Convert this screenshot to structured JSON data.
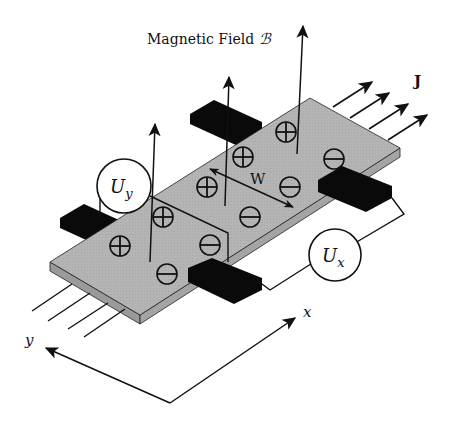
{
  "labels": {
    "magnetic_field": "Magnetic Field",
    "magnetic_field_symbol": "ℬ",
    "current_density": "J",
    "width": "W",
    "hall_voltage_main": "U",
    "hall_voltage_sub": "y",
    "longitudinal_voltage_main": "U",
    "longitudinal_voltage_sub": "x",
    "axis_x": "x",
    "axis_y": "y"
  },
  "charges": {
    "positive_symbol": "+",
    "negative_symbol": "−",
    "positive_count": 5,
    "negative_count": 5
  },
  "colors": {
    "slab_top": "#b4b4b4",
    "slab_side": "#9a9a9a",
    "contact": "#0a0a0a",
    "line": "#111111",
    "background": "#ffffff"
  }
}
